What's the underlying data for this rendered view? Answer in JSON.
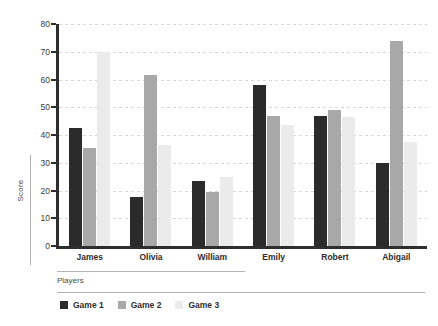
{
  "chart_data": {
    "type": "bar",
    "title": "",
    "xlabel": "Players",
    "ylabel": "Score",
    "ylim": [
      0,
      80
    ],
    "yticks": [
      0,
      10,
      20,
      30,
      40,
      50,
      60,
      70,
      80
    ],
    "grid": true,
    "legend_position": "bottom-left",
    "categories": [
      "James",
      "Olivia",
      "William",
      "Emily",
      "Robert",
      "Abigail"
    ],
    "series": [
      {
        "name": "Game 1",
        "color": "#2b2b2b",
        "values": [
          42.5,
          17.5,
          23.5,
          58,
          47,
          30
        ]
      },
      {
        "name": "Game 2",
        "color": "#a8a8a8",
        "values": [
          35.5,
          61.5,
          19.5,
          47,
          49,
          74
        ]
      },
      {
        "name": "Game 3",
        "color": "#ebebeb",
        "values": [
          70,
          36.5,
          25,
          43.5,
          46.5,
          37.5
        ]
      }
    ]
  }
}
